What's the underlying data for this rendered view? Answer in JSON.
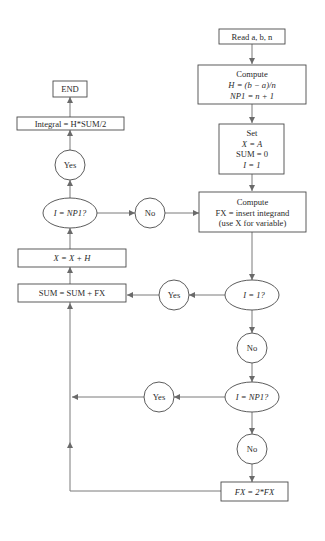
{
  "diagram": {
    "type": "flowchart",
    "colors": {
      "line": "#7a7a7a",
      "border": "#4a4a4a",
      "text": "#2a2a2a",
      "background": "#ffffff"
    },
    "nodes": {
      "read": {
        "shape": "rect",
        "lines": [
          "Read a, b, n"
        ]
      },
      "compute_h": {
        "shape": "rect",
        "lines": [
          "Compute",
          "H = (b − a)/n",
          "NP1 = n + 1"
        ]
      },
      "set": {
        "shape": "rect",
        "lines": [
          "Set",
          "X = A",
          "SUM = 0",
          "I = 1"
        ]
      },
      "compute_fx": {
        "shape": "rect",
        "lines": [
          "Compute",
          "FX = insert integrand",
          "(use X for variable)"
        ]
      },
      "dec_i1": {
        "shape": "ellipse",
        "lines": [
          "I = 1?"
        ]
      },
      "yes_i1": {
        "shape": "circle",
        "lines": [
          "Yes"
        ]
      },
      "no_i1": {
        "shape": "circle",
        "lines": [
          "No"
        ]
      },
      "dec_inp1_right": {
        "shape": "ellipse",
        "lines": [
          "I = NP1?"
        ]
      },
      "yes_inp1_right": {
        "shape": "circle",
        "lines": [
          "Yes"
        ]
      },
      "no_inp1_right": {
        "shape": "circle",
        "lines": [
          "No"
        ]
      },
      "double_fx": {
        "shape": "rect",
        "lines": [
          "FX = 2*FX"
        ]
      },
      "sum": {
        "shape": "rect",
        "lines": [
          "SUM = SUM + FX"
        ]
      },
      "x_inc": {
        "shape": "rect",
        "lines": [
          "X = X + H"
        ]
      },
      "dec_inp1_left": {
        "shape": "ellipse",
        "lines": [
          "I = NP1?"
        ]
      },
      "no_left": {
        "shape": "circle",
        "lines": [
          "No"
        ]
      },
      "yes_left": {
        "shape": "circle",
        "lines": [
          "Yes"
        ]
      },
      "integral": {
        "shape": "rect",
        "lines": [
          "Integral = H*SUM/2"
        ]
      },
      "end": {
        "shape": "rect",
        "lines": [
          "END"
        ]
      }
    },
    "edges": [
      [
        "read",
        "compute_h"
      ],
      [
        "compute_h",
        "set"
      ],
      [
        "set",
        "compute_fx"
      ],
      [
        "compute_fx",
        "dec_i1"
      ],
      [
        "dec_i1",
        "yes_i1"
      ],
      [
        "yes_i1",
        "sum"
      ],
      [
        "dec_i1",
        "no_i1"
      ],
      [
        "no_i1",
        "dec_inp1_right"
      ],
      [
        "dec_inp1_right",
        "yes_inp1_right"
      ],
      [
        "yes_inp1_right",
        "sum"
      ],
      [
        "dec_inp1_right",
        "no_inp1_right"
      ],
      [
        "no_inp1_right",
        "double_fx"
      ],
      [
        "double_fx",
        "sum"
      ],
      [
        "sum",
        "x_inc"
      ],
      [
        "x_inc",
        "dec_inp1_left"
      ],
      [
        "dec_inp1_left",
        "no_left"
      ],
      [
        "no_left",
        "compute_fx"
      ],
      [
        "dec_inp1_left",
        "yes_left"
      ],
      [
        "yes_left",
        "integral"
      ],
      [
        "integral",
        "end"
      ]
    ]
  }
}
